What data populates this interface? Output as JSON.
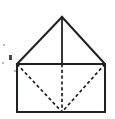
{
  "figure": {
    "kind": "geometry-line-drawing",
    "stroke_color": "#231f20",
    "background_color": "#ffffff",
    "canvas": {
      "width": 115,
      "height": 119
    },
    "vertices": {
      "apex": {
        "x": 62,
        "y": 17
      },
      "top_left": {
        "x": 17,
        "y": 64
      },
      "top_right": {
        "x": 105,
        "y": 64
      },
      "top_center": {
        "x": 62,
        "y": 64
      },
      "bottom_left": {
        "x": 17,
        "y": 112
      },
      "bottom_right": {
        "x": 105,
        "y": 112
      },
      "bottom_center": {
        "x": 62,
        "y": 112
      }
    },
    "solid_edges": [
      {
        "name": "apex-to-top-left",
        "d": "M 62 17 L 17 64"
      },
      {
        "name": "apex-to-top-right",
        "d": "M 62 17 L 105 64"
      },
      {
        "name": "apex-vertical-to-top-center",
        "d": "M 62 17 L 62 64"
      },
      {
        "name": "base-top-edge",
        "d": "M 17 64 L 105 64"
      },
      {
        "name": "base-left-edge",
        "d": "M 17 64 L 17 112"
      },
      {
        "name": "base-right-edge",
        "d": "M 105 64 L 105 112"
      },
      {
        "name": "base-bottom-edge",
        "d": "M 17 112 L 105 112"
      }
    ],
    "hidden_edges": [
      {
        "name": "hidden-vertical-axis",
        "d": "M 62 64 L 62 112"
      },
      {
        "name": "hidden-diagonal-left",
        "d": "M 17 64 L 62 112"
      },
      {
        "name": "hidden-diagonal-right",
        "d": "M 105 64 L 62 112"
      }
    ],
    "specks": [
      {
        "name": "speck-upper-left",
        "x": 3,
        "y": 44,
        "w": 2,
        "h": 2,
        "faint": true
      },
      {
        "name": "speck-left-edge",
        "x": 9,
        "y": 55,
        "w": 3,
        "h": 5,
        "faint": false
      },
      {
        "name": "speck-left-lower",
        "x": 2,
        "y": 62,
        "w": 2,
        "h": 2,
        "faint": true
      },
      {
        "name": "speck-inner-left",
        "x": 14,
        "y": 70,
        "w": 2,
        "h": 2,
        "faint": true
      }
    ]
  }
}
